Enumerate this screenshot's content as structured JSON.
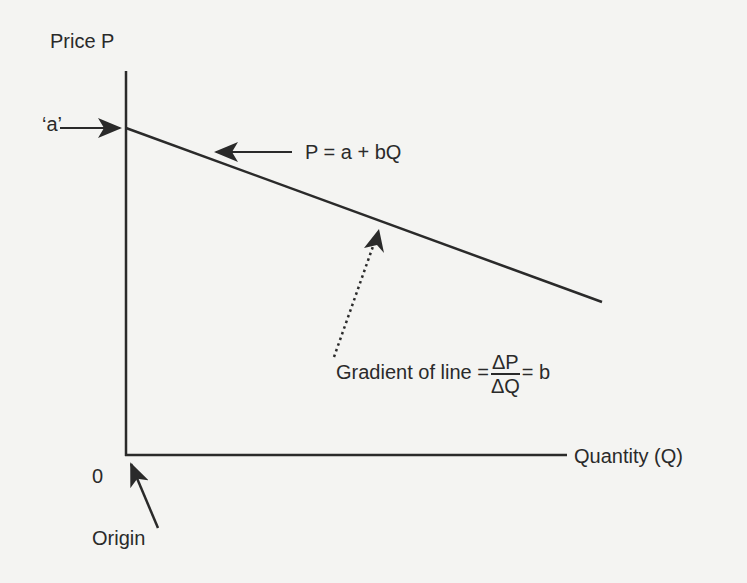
{
  "diagram": {
    "y_axis_label": "Price P",
    "x_axis_label": "Quantity (Q)",
    "intercept_label": "‘a’",
    "origin_zero": "0",
    "origin_label": "Origin",
    "equation_label": "P = a + bQ",
    "gradient": {
      "prefix": "Gradient of line =",
      "numerator": "ΔP",
      "denominator": "ΔQ",
      "suffix": "= b"
    },
    "colors": {
      "line": "#2a2a2a",
      "background": "#f4f4f2"
    },
    "geometry": {
      "y_axis": {
        "x": 126,
        "y_top": 71,
        "y_bottom": 455
      },
      "x_axis": {
        "y": 455,
        "x_left": 126,
        "x_right": 567
      },
      "demand_line": {
        "x1": 126,
        "y1": 128,
        "x2": 602,
        "y2": 302
      }
    }
  }
}
